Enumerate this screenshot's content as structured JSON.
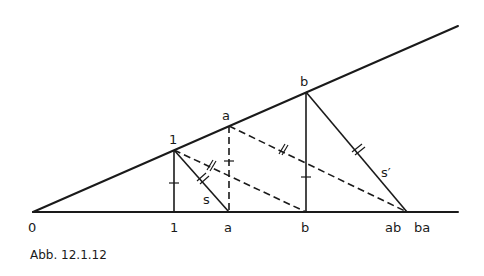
{
  "figure": {
    "caption": "Abb. 12.1.12",
    "labels": {
      "origin": "0",
      "axis_1": "1",
      "axis_a": "a",
      "axis_b": "b",
      "axis_ab": "ab",
      "axis_ba": "ba",
      "ray_1": "1",
      "ray_a": "a",
      "ray_b": "b",
      "segment_s": "s",
      "segment_s_prime": "s′"
    }
  }
}
